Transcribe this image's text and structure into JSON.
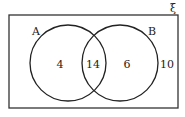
{
  "diagram": {
    "type": "venn",
    "universal_symbol": "ξ",
    "sets": [
      {
        "name": "A",
        "label": "A"
      },
      {
        "name": "B",
        "label": "B"
      }
    ],
    "regions": {
      "only_A": "4",
      "A_and_B": "14",
      "only_B": "6",
      "outside": "10"
    },
    "colors": {
      "stroke": "#222222",
      "background": "#ffffff"
    }
  }
}
